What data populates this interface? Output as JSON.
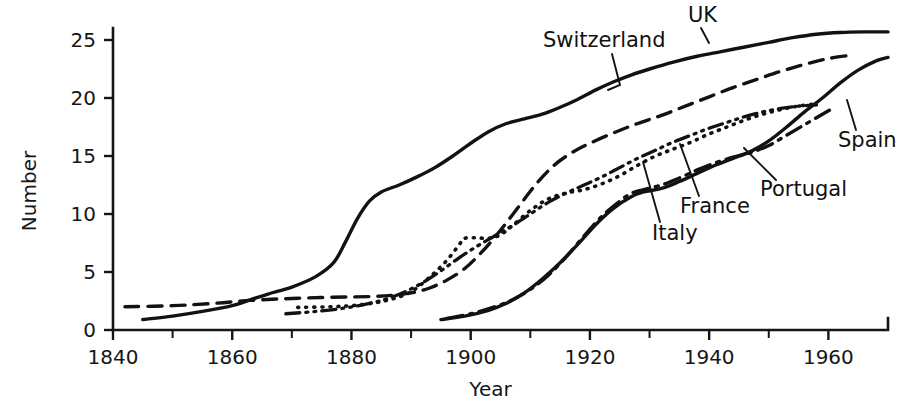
{
  "chart_data": {
    "type": "line",
    "title": "",
    "xlabel": "Year",
    "ylabel": "Number",
    "xlim": [
      1840,
      1970
    ],
    "ylim": [
      0,
      26.5
    ],
    "grid": false,
    "legend_position": "inline-labels",
    "x_ticks_major": [
      1840,
      1860,
      1880,
      1900,
      1920,
      1940,
      1960
    ],
    "x_ticks_minor": [
      1850,
      1870,
      1890,
      1910,
      1930,
      1950
    ],
    "x_tick_labels": [
      "1840",
      "1860",
      "1880",
      "1900",
      "1920",
      "1940",
      "1960"
    ],
    "y_ticks": [
      0,
      5,
      10,
      15,
      20,
      25
    ],
    "y_tick_labels": [
      "0",
      "5",
      "10",
      "15",
      "20",
      "25"
    ],
    "series": [
      {
        "name": "UK",
        "label": "UK",
        "style": "solid",
        "stroke_width": 3.4,
        "dash": "none",
        "points": [
          [
            1845,
            0.9
          ],
          [
            1850,
            1.2
          ],
          [
            1855,
            1.6
          ],
          [
            1860,
            2.1
          ],
          [
            1863,
            2.6
          ],
          [
            1866,
            3.1
          ],
          [
            1870,
            3.7
          ],
          [
            1874,
            4.6
          ],
          [
            1877,
            5.8
          ],
          [
            1879,
            7.6
          ],
          [
            1881,
            9.6
          ],
          [
            1883,
            11.1
          ],
          [
            1885,
            11.9
          ],
          [
            1888,
            12.5
          ],
          [
            1891,
            13.2
          ],
          [
            1894,
            14.0
          ],
          [
            1897,
            15.0
          ],
          [
            1900,
            16.1
          ],
          [
            1903,
            17.1
          ],
          [
            1906,
            17.8
          ],
          [
            1909,
            18.2
          ],
          [
            1912,
            18.6
          ],
          [
            1915,
            19.2
          ],
          [
            1918,
            19.9
          ],
          [
            1921,
            20.7
          ],
          [
            1924,
            21.4
          ],
          [
            1927,
            22.0
          ],
          [
            1930,
            22.5
          ],
          [
            1934,
            23.1
          ],
          [
            1938,
            23.6
          ],
          [
            1942,
            24.0
          ],
          [
            1946,
            24.4
          ],
          [
            1950,
            24.8
          ],
          [
            1954,
            25.2
          ],
          [
            1958,
            25.5
          ],
          [
            1962,
            25.65
          ],
          [
            1966,
            25.7
          ],
          [
            1970,
            25.7
          ]
        ]
      },
      {
        "name": "Switzerland",
        "label": "Switzerland",
        "style": "dashed",
        "stroke_width": 3.4,
        "dash": "14 9",
        "points": [
          [
            1842,
            2.0
          ],
          [
            1850,
            2.1
          ],
          [
            1857,
            2.3
          ],
          [
            1863,
            2.55
          ],
          [
            1869,
            2.7
          ],
          [
            1875,
            2.8
          ],
          [
            1880,
            2.85
          ],
          [
            1884,
            2.9
          ],
          [
            1887,
            3.0
          ],
          [
            1890,
            3.2
          ],
          [
            1893,
            3.6
          ],
          [
            1896,
            4.3
          ],
          [
            1899,
            5.3
          ],
          [
            1902,
            6.8
          ],
          [
            1905,
            8.6
          ],
          [
            1908,
            10.6
          ],
          [
            1911,
            12.6
          ],
          [
            1914,
            14.2
          ],
          [
            1917,
            15.3
          ],
          [
            1920,
            16.1
          ],
          [
            1924,
            17.0
          ],
          [
            1928,
            17.8
          ],
          [
            1932,
            18.5
          ],
          [
            1936,
            19.3
          ],
          [
            1940,
            20.1
          ],
          [
            1944,
            20.9
          ],
          [
            1948,
            21.6
          ],
          [
            1952,
            22.3
          ],
          [
            1956,
            22.9
          ],
          [
            1960,
            23.4
          ],
          [
            1964,
            23.7
          ]
        ]
      },
      {
        "name": "Italy",
        "label": "Italy",
        "style": "dotted",
        "stroke_width": 3.6,
        "dash": "1 7",
        "points": [
          [
            1871,
            1.95
          ],
          [
            1876,
            2.0
          ],
          [
            1880,
            2.1
          ],
          [
            1884,
            2.35
          ],
          [
            1887,
            2.7
          ],
          [
            1890,
            3.3
          ],
          [
            1893,
            4.5
          ],
          [
            1896,
            6.0
          ],
          [
            1898,
            7.3
          ],
          [
            1899,
            7.9
          ],
          [
            1901,
            7.95
          ],
          [
            1903,
            7.9
          ],
          [
            1905,
            8.2
          ],
          [
            1907,
            9.0
          ],
          [
            1910,
            10.3
          ],
          [
            1913,
            11.3
          ],
          [
            1916,
            11.8
          ],
          [
            1919,
            12.1
          ],
          [
            1922,
            12.6
          ],
          [
            1925,
            13.3
          ],
          [
            1928,
            14.2
          ],
          [
            1931,
            15.0
          ],
          [
            1934,
            15.6
          ],
          [
            1937,
            16.2
          ],
          [
            1940,
            16.9
          ],
          [
            1943,
            17.5
          ],
          [
            1946,
            18.1
          ],
          [
            1949,
            18.6
          ],
          [
            1952,
            19.0
          ],
          [
            1955,
            19.3
          ],
          [
            1958,
            19.5
          ]
        ]
      },
      {
        "name": "France",
        "label": "France",
        "style": "dash-dot-dot",
        "stroke_width": 3.3,
        "dash": "14 6 2 6 2 6",
        "points": [
          [
            1869,
            1.4
          ],
          [
            1874,
            1.6
          ],
          [
            1879,
            1.9
          ],
          [
            1883,
            2.3
          ],
          [
            1886,
            2.7
          ],
          [
            1889,
            3.3
          ],
          [
            1892,
            4.1
          ],
          [
            1895,
            5.1
          ],
          [
            1898,
            6.2
          ],
          [
            1901,
            7.2
          ],
          [
            1904,
            8.1
          ],
          [
            1907,
            9.0
          ],
          [
            1910,
            10.0
          ],
          [
            1913,
            11.0
          ],
          [
            1916,
            11.8
          ],
          [
            1919,
            12.5
          ],
          [
            1922,
            13.2
          ],
          [
            1925,
            14.0
          ],
          [
            1928,
            14.8
          ],
          [
            1931,
            15.5
          ],
          [
            1934,
            16.2
          ],
          [
            1937,
            16.8
          ],
          [
            1940,
            17.4
          ],
          [
            1943,
            17.9
          ],
          [
            1946,
            18.4
          ],
          [
            1949,
            18.8
          ],
          [
            1952,
            19.1
          ],
          [
            1955,
            19.3
          ],
          [
            1958,
            19.4
          ]
        ]
      },
      {
        "name": "Portugal",
        "label": "Portugal",
        "style": "dash-dot",
        "stroke_width": 3.4,
        "dash": "16 7 3 7",
        "points": [
          [
            1896,
            1.0
          ],
          [
            1900,
            1.4
          ],
          [
            1904,
            2.0
          ],
          [
            1907,
            2.6
          ],
          [
            1910,
            3.5
          ],
          [
            1913,
            4.7
          ],
          [
            1916,
            6.3
          ],
          [
            1919,
            8.1
          ],
          [
            1922,
            9.8
          ],
          [
            1925,
            11.1
          ],
          [
            1927,
            11.8
          ],
          [
            1929,
            12.1
          ],
          [
            1932,
            12.5
          ],
          [
            1935,
            13.1
          ],
          [
            1938,
            13.8
          ],
          [
            1941,
            14.4
          ],
          [
            1944,
            14.9
          ],
          [
            1947,
            15.3
          ],
          [
            1950,
            15.9
          ],
          [
            1953,
            16.8
          ],
          [
            1956,
            17.7
          ],
          [
            1959,
            18.6
          ],
          [
            1961,
            19.2
          ]
        ]
      },
      {
        "name": "Spain",
        "label": "Spain",
        "style": "solid",
        "stroke_width": 3.4,
        "dash": "none",
        "points": [
          [
            1895,
            0.9
          ],
          [
            1899,
            1.2
          ],
          [
            1903,
            1.7
          ],
          [
            1906,
            2.3
          ],
          [
            1909,
            3.2
          ],
          [
            1912,
            4.4
          ],
          [
            1915,
            5.8
          ],
          [
            1918,
            7.4
          ],
          [
            1921,
            9.1
          ],
          [
            1924,
            10.5
          ],
          [
            1927,
            11.5
          ],
          [
            1929,
            11.9
          ],
          [
            1932,
            12.2
          ],
          [
            1935,
            12.8
          ],
          [
            1938,
            13.5
          ],
          [
            1941,
            14.2
          ],
          [
            1944,
            14.8
          ],
          [
            1947,
            15.4
          ],
          [
            1950,
            16.3
          ],
          [
            1953,
            17.5
          ],
          [
            1956,
            18.8
          ],
          [
            1959,
            20.0
          ],
          [
            1962,
            21.3
          ],
          [
            1965,
            22.4
          ],
          [
            1968,
            23.2
          ],
          [
            1970,
            23.5
          ]
        ]
      }
    ],
    "annotations": [
      {
        "text": "Switzerland",
        "text_x": 543,
        "text_y": 47,
        "leader": "612,54 620,85 608,90"
      },
      {
        "text": "UK",
        "text_x": 688,
        "text_y": 22,
        "leader": "701,28 709,43"
      },
      {
        "text": "Spain",
        "text_x": 838,
        "text_y": 147,
        "leader": "856,130 847,100"
      },
      {
        "text": "Portugal",
        "text_x": 760,
        "text_y": 196,
        "leader": "776,180 744,148"
      },
      {
        "text": "France",
        "text_x": 680,
        "text_y": 213,
        "leader": "699,196 680,144"
      },
      {
        "text": "Italy",
        "text_x": 652,
        "text_y": 240,
        "leader": "660,222 643,162"
      }
    ]
  }
}
